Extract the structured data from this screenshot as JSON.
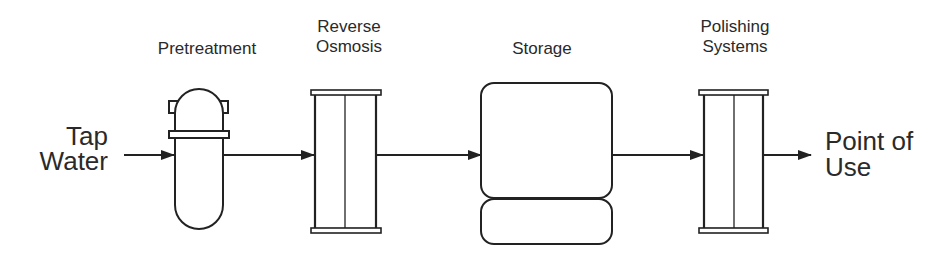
{
  "diagram": {
    "type": "process-flow",
    "colors": {
      "stroke": "#222222",
      "text": "#2a2a2a",
      "background": "#ffffff"
    },
    "input": {
      "lines": [
        "Tap",
        "Water"
      ]
    },
    "output": {
      "lines": [
        "Point of",
        "Use"
      ]
    },
    "stages": [
      {
        "id": "pretreatment",
        "lines": [
          "Pretreatment"
        ],
        "shape": "pressure-vessel"
      },
      {
        "id": "reverse-osmosis",
        "lines": [
          "Reverse",
          "Osmosis"
        ],
        "shape": "membrane-module"
      },
      {
        "id": "storage",
        "lines": [
          "Storage"
        ],
        "shape": "storage-tank"
      },
      {
        "id": "polishing-systems",
        "lines": [
          "Polishing",
          "Systems"
        ],
        "shape": "membrane-module"
      }
    ],
    "flow": [
      "Tap Water",
      "Pretreatment",
      "Reverse Osmosis",
      "Storage",
      "Polishing Systems",
      "Point of Use"
    ]
  }
}
